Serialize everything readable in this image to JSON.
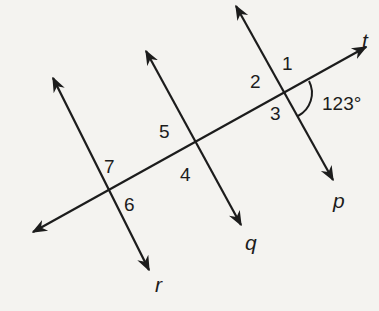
{
  "diagram": {
    "lines": {
      "t": "t",
      "p": "p",
      "q": "q",
      "r": "r"
    },
    "angle_labels": {
      "a1": "1",
      "a2": "2",
      "a3": "3",
      "a4": "4",
      "a5": "5",
      "a6": "6",
      "a7": "7"
    },
    "given_angle": "123°",
    "colors": {
      "ink": "#1c1c1c",
      "paper": "#f4f3f0"
    }
  }
}
